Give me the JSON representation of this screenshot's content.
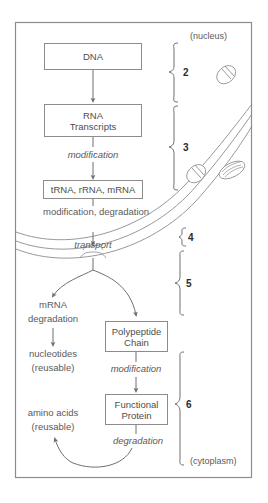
{
  "diagram": {
    "frame": {
      "stroke": "#8c8c8c"
    },
    "regions": {
      "nucleus_label": "(nucleus)",
      "cytoplasm_label": "(cytoplasm)"
    },
    "boxes": [
      {
        "id": "dna",
        "label": "DNA"
      },
      {
        "id": "rna",
        "label": "RNA\nTranscripts"
      },
      {
        "id": "rnas",
        "label": "tRNA, rRNA, mRNA"
      },
      {
        "id": "polypeptide",
        "label": "Polypeptide\nChain"
      },
      {
        "id": "protein",
        "label": "Functional\nProtein"
      }
    ],
    "process_labels": [
      {
        "id": "modification-1",
        "text": "modification",
        "italic": true
      },
      {
        "id": "modification-2",
        "text": "modification,\ndegradation",
        "italic": false
      },
      {
        "id": "transport",
        "text": "transport",
        "italic": true
      },
      {
        "id": "modification-3",
        "text": "modification",
        "italic": true
      },
      {
        "id": "degradation-final",
        "text": "degradation",
        "italic": true
      }
    ],
    "product_labels": [
      {
        "id": "mrna-degradation",
        "line1": "mRNA",
        "line2": "degradation"
      },
      {
        "id": "nucleotides",
        "line1": "nucleotides",
        "line2": "(reusable)"
      },
      {
        "id": "amino-acids",
        "line1": "amino acids",
        "line2": "(reusable)"
      }
    ],
    "step_braces": [
      {
        "id": "brace-2",
        "number": "2"
      },
      {
        "id": "brace-3",
        "number": "3"
      },
      {
        "id": "brace-4",
        "number": "4"
      },
      {
        "id": "brace-5",
        "number": "5"
      },
      {
        "id": "brace-6",
        "number": "6"
      }
    ],
    "organelles": [
      {
        "id": "nuclear-pore-upper"
      },
      {
        "id": "nuclear-pore-lower"
      },
      {
        "id": "ribosome-ellipse"
      }
    ],
    "colors": {
      "line": "#8c8c8c",
      "text": "#5a5a5a",
      "number": "#2b2b2b",
      "background": "#ffffff"
    }
  }
}
